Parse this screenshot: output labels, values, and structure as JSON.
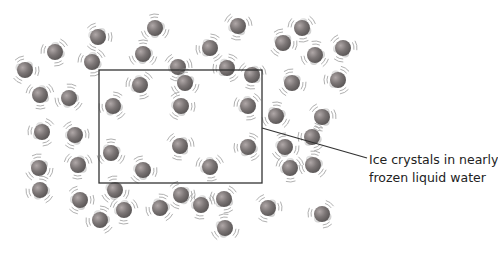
{
  "diagram": {
    "callout": {
      "line1": "Ice crystals in nearly",
      "line2": "frozen liquid water"
    },
    "highlight_box": {
      "x": 99,
      "y": 70,
      "w": 163,
      "h": 113
    },
    "leader_line": {
      "x1": 262,
      "y1": 128,
      "x2": 367,
      "y2": 158
    },
    "colors": {
      "oxygen": "#7a7a7a",
      "oxygen_highlight": "#a8a8a8",
      "hydrogen": "#e4e4e4",
      "vibration": "#9a9a9a",
      "box": "#333333"
    },
    "molecules": [
      [
        98,
        37
      ],
      [
        55,
        52
      ],
      [
        155,
        28
      ],
      [
        238,
        26
      ],
      [
        210,
        48
      ],
      [
        25,
        70
      ],
      [
        92,
        62
      ],
      [
        143,
        54
      ],
      [
        178,
        67
      ],
      [
        227,
        68
      ],
      [
        283,
        43
      ],
      [
        302,
        28
      ],
      [
        315,
        55
      ],
      [
        343,
        48
      ],
      [
        338,
        80
      ],
      [
        292,
        83
      ],
      [
        40,
        95
      ],
      [
        69,
        98
      ],
      [
        75,
        135
      ],
      [
        42,
        132
      ],
      [
        39,
        168
      ],
      [
        78,
        165
      ],
      [
        40,
        190
      ],
      [
        80,
        200
      ],
      [
        140,
        85
      ],
      [
        185,
        83
      ],
      [
        252,
        75
      ],
      [
        113,
        106
      ],
      [
        181,
        106
      ],
      [
        248,
        106
      ],
      [
        111,
        153
      ],
      [
        180,
        146
      ],
      [
        248,
        147
      ],
      [
        143,
        170
      ],
      [
        210,
        167
      ],
      [
        276,
        116
      ],
      [
        322,
        117
      ],
      [
        312,
        137
      ],
      [
        285,
        147
      ],
      [
        290,
        168
      ],
      [
        313,
        165
      ],
      [
        268,
        208
      ],
      [
        322,
        214
      ],
      [
        115,
        190
      ],
      [
        124,
        210
      ],
      [
        160,
        208
      ],
      [
        181,
        195
      ],
      [
        224,
        199
      ],
      [
        225,
        228
      ],
      [
        201,
        205
      ],
      [
        100,
        220
      ]
    ]
  }
}
